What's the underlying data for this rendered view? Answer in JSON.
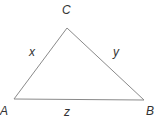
{
  "diagram": {
    "type": "triangle",
    "stroke_color": "#8a8a8a",
    "label_color": "#333333",
    "vertices": [
      {
        "name": "C",
        "x": 67,
        "y": 28
      },
      {
        "name": "A",
        "x": 14,
        "y": 99
      },
      {
        "name": "B",
        "x": 144,
        "y": 100
      }
    ],
    "vertex_labels": {
      "C": "C",
      "A": "A",
      "B": "B"
    },
    "side_labels": {
      "AC": "x",
      "CB": "y",
      "AB": "z"
    }
  }
}
